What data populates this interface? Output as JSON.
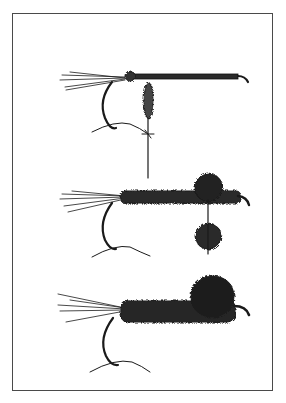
{
  "figure": {
    "type": "line-illustration",
    "panels": [
      {
        "name": "stage-1",
        "description": "hook with tail fibers, thread-wrapped shank, dubbing loop hanging down"
      },
      {
        "name": "stage-2",
        "description": "dubbed body with hackle/wing tufts above and below near eye"
      },
      {
        "name": "stage-3",
        "description": "finished fly with full dubbed body and thorax tuft"
      }
    ],
    "caption": "",
    "colors": {
      "ink": "#1a1a1a",
      "frame": "#4a4a4a",
      "paper": "#ffffff",
      "caption": "#c8c8c8"
    }
  }
}
